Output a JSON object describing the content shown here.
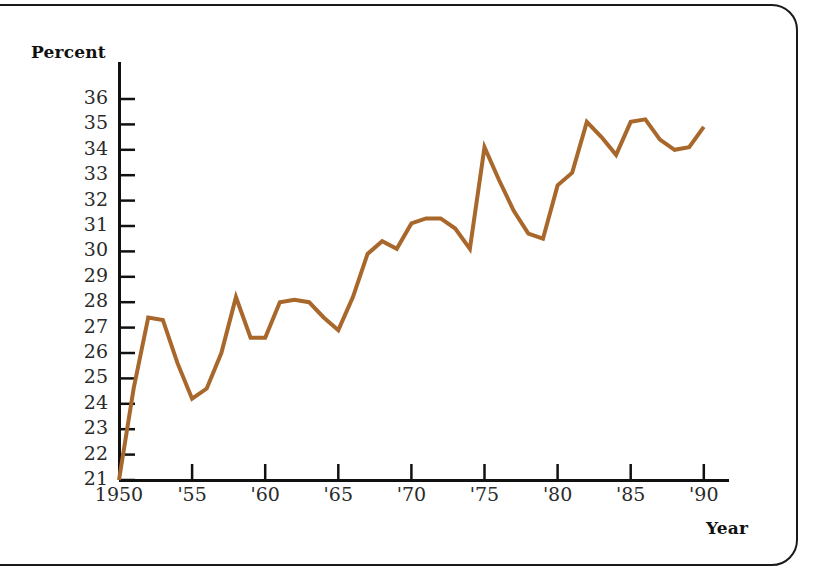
{
  "figure": {
    "frame": "rounded-rect-border",
    "background": "#ffffff"
  },
  "chart_data": {
    "type": "line",
    "title": "",
    "xlabel": "Year",
    "ylabel": "Percent",
    "xlim": [
      1950,
      1992
    ],
    "ylim": [
      21,
      36
    ],
    "grid": false,
    "legend": false,
    "line_color": "#A8672B",
    "line_width": 4,
    "x_tick_labels": [
      "1950",
      "'55",
      "'60",
      "'65",
      "'70",
      "'75",
      "'80",
      "'85",
      "'90"
    ],
    "x_tick_values": [
      1950,
      1955,
      1960,
      1965,
      1970,
      1975,
      1980,
      1985,
      1990
    ],
    "y_tick_labels": [
      "36",
      "35",
      "34",
      "33",
      "32",
      "31",
      "30",
      "29",
      "28",
      "27",
      "26",
      "25",
      "24",
      "23",
      "22",
      "21"
    ],
    "y_tick_values": [
      36,
      35,
      34,
      33,
      32,
      31,
      30,
      29,
      28,
      27,
      26,
      25,
      24,
      23,
      22,
      21
    ],
    "x": [
      1950,
      1951,
      1952,
      1953,
      1954,
      1955,
      1956,
      1957,
      1958,
      1959,
      1960,
      1961,
      1962,
      1963,
      1964,
      1965,
      1966,
      1967,
      1968,
      1969,
      1970,
      1971,
      1972,
      1973,
      1974,
      1975,
      1976,
      1977,
      1978,
      1979,
      1980,
      1981,
      1982,
      1983,
      1984,
      1985,
      1986,
      1987,
      1988,
      1989,
      1990
    ],
    "values": [
      21.0,
      24.6,
      27.4,
      27.3,
      25.6,
      24.2,
      24.6,
      26.0,
      28.2,
      26.6,
      26.6,
      28.0,
      28.1,
      28.0,
      27.4,
      26.9,
      28.2,
      29.9,
      30.4,
      30.1,
      31.1,
      31.3,
      31.3,
      30.9,
      30.1,
      34.1,
      32.8,
      31.6,
      30.7,
      30.5,
      32.6,
      33.1,
      35.1,
      34.5,
      33.8,
      35.1,
      35.2,
      34.4,
      34.0,
      34.1,
      34.9
    ],
    "series": [
      {
        "name": "Percent",
        "values": [
          21.0,
          24.6,
          27.4,
          27.3,
          25.6,
          24.2,
          24.6,
          26.0,
          28.2,
          26.6,
          26.6,
          28.0,
          28.1,
          28.0,
          27.4,
          26.9,
          28.2,
          29.9,
          30.4,
          30.1,
          31.1,
          31.3,
          31.3,
          30.9,
          30.1,
          34.1,
          32.8,
          31.6,
          30.7,
          30.5,
          32.6,
          33.1,
          35.1,
          34.5,
          33.8,
          35.1,
          35.2,
          34.4,
          34.0,
          34.1,
          34.9
        ]
      }
    ]
  },
  "labels": {
    "percent": "Percent",
    "year": "Year"
  }
}
